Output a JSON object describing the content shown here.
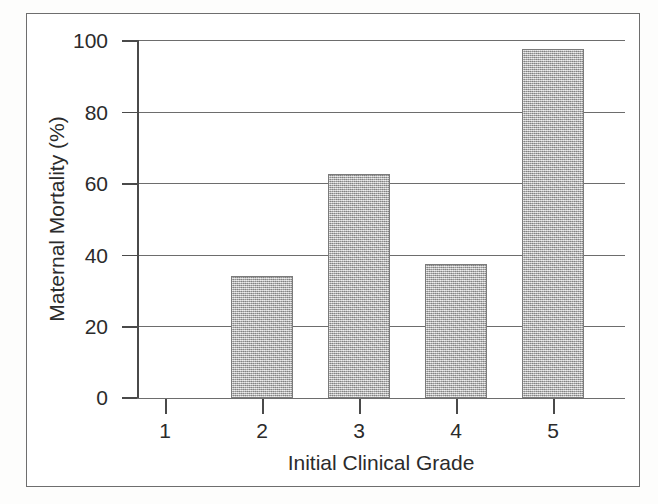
{
  "chart_data": {
    "type": "bar",
    "title": "",
    "xlabel": "Initial Clinical Grade",
    "ylabel": "Maternal Mortality (%)",
    "categories": [
      "1",
      "2",
      "3",
      "4",
      "5"
    ],
    "values": [
      0,
      34,
      62.5,
      37.5,
      97.5
    ],
    "ylim": [
      0,
      100
    ],
    "yticks": [
      0,
      20,
      40,
      60,
      80,
      100
    ],
    "ytick_labels": [
      "0",
      "20",
      "40",
      "60",
      "80",
      "100"
    ],
    "xticks": [
      "1",
      "2",
      "3",
      "4",
      "5"
    ],
    "grid": "horizontal",
    "legend": "none",
    "bar_color": "#ababab",
    "bar_edge_color": "#7b7b7b",
    "axis_color": "#4a4a4a",
    "grid_color": "#6d6d6d",
    "frame_color": "#6e6e6e",
    "background": "#ffffff"
  },
  "figure": {
    "frame_present": "true"
  }
}
